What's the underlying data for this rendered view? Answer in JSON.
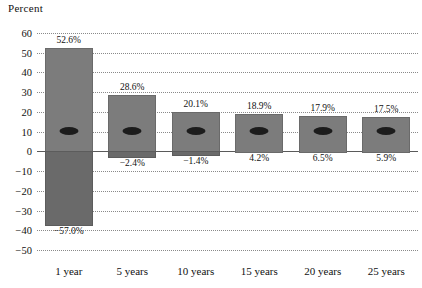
{
  "chart_data": {
    "type": "bar",
    "title": "",
    "ylabel": "Percent",
    "xlabel": "",
    "ylim": [
      -50,
      60
    ],
    "yticks": [
      60,
      50,
      40,
      30,
      20,
      10,
      0,
      -10,
      -20,
      -30,
      -40,
      -50
    ],
    "grid": true,
    "legend": "none",
    "categories": [
      "1 year",
      "5 years",
      "10 years",
      "15 years",
      "20 years",
      "25 years"
    ],
    "series": [
      {
        "name": "Best return",
        "values": [
          52.6,
          28.6,
          20.1,
          18.9,
          17.9,
          17.5
        ],
        "labels": [
          "52.6%",
          "28.6%",
          "20.1%",
          "18.9%",
          "17.9%",
          "17.5%"
        ]
      },
      {
        "name": "Worst return",
        "values": [
          -37.0,
          -2.4,
          -1.4,
          4.2,
          6.5,
          5.9
        ],
        "labels": [
          "-57.0%",
          "-2.4%",
          "-1.4%",
          "4.2%",
          "6.5%",
          "5.9%"
        ]
      },
      {
        "name": "Average return",
        "values": [
          10.5,
          10.5,
          10.5,
          10.5,
          10.5,
          10.5
        ]
      }
    ]
  },
  "axis": {
    "y_title": "Percent"
  },
  "colors": {
    "bar_positive": "#7c7c7c",
    "bar_negative": "#6a6a6a",
    "marker": "#1c1c1c",
    "grid": "#8a8a8a",
    "zero_line": "#5a5a5a",
    "text": "#111111"
  },
  "caption": {
    "text": ""
  }
}
